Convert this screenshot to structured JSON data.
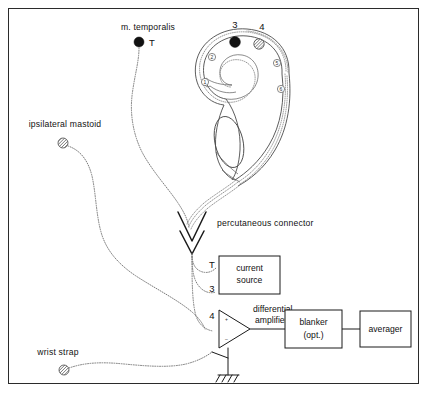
{
  "figure": {
    "type": "diagram",
    "background": "#ffffff",
    "border_color": "#2b2b2b"
  },
  "surface_electrodes": [
    {
      "id": "m-temporalis",
      "label": "m. temporalis",
      "marker_label": "T",
      "fill": "solid-black",
      "color": "#111111"
    },
    {
      "id": "ipsilateral-mastoid",
      "label": "ipsilateral mastoid",
      "marker_label": "",
      "fill": "hatched",
      "color": "#6a6a6a"
    },
    {
      "id": "wrist-strap",
      "label": "wrist strap",
      "marker_label": "",
      "fill": "hatched",
      "color": "#6a6a6a"
    }
  ],
  "cochlea": {
    "label": "",
    "electrodes": [
      {
        "number": "1",
        "style": "open-circle",
        "position": "apical-inner"
      },
      {
        "number": "2",
        "style": "open-circle",
        "position": "apical-inner"
      },
      {
        "number": "3",
        "style": "solid-black",
        "position": "mid-outer"
      },
      {
        "number": "4",
        "style": "hatched",
        "position": "mid-outer"
      },
      {
        "number": "5",
        "style": "open-circle",
        "position": "basal-outer"
      },
      {
        "number": "6",
        "style": "open-circle",
        "position": "basal-outer"
      }
    ]
  },
  "connector": {
    "label": "percutaneous connector",
    "symbol": "double-chevron"
  },
  "blocks": [
    {
      "id": "current-source",
      "lines": [
        "current",
        "source"
      ],
      "inputs": [
        "T",
        "3"
      ]
    },
    {
      "id": "differential-amplifier",
      "lines": [
        "differential",
        "amplifier"
      ],
      "inputs": [
        "4"
      ],
      "plus": "+",
      "minus": "–"
    },
    {
      "id": "blanker",
      "lines": [
        "blanker",
        "(opt.)"
      ],
      "inputs": []
    },
    {
      "id": "averager",
      "lines": [
        "averager"
      ],
      "inputs": []
    }
  ],
  "ground": {
    "label": "",
    "symbol": "earth-ground"
  }
}
